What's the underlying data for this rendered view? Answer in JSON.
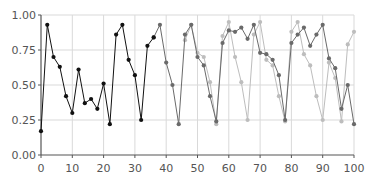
{
  "chart_data": {
    "type": "line",
    "title": "",
    "xlabel": "",
    "ylabel": "",
    "xlim": [
      0,
      100
    ],
    "ylim": [
      0,
      1
    ],
    "xticks": [
      0,
      10,
      20,
      30,
      40,
      50,
      60,
      70,
      80,
      90,
      100
    ],
    "xtick_labels": [
      "0",
      "10",
      "20",
      "30",
      "40",
      "50",
      "60",
      "70",
      "80",
      "90",
      "100"
    ],
    "yticks": [
      0,
      0.25,
      0.5,
      0.75,
      1.0
    ],
    "ytick_labels": [
      "0.00",
      "0.25",
      "0.50",
      "0.75",
      "1.00"
    ],
    "grid": true,
    "legend": null,
    "series": [
      {
        "name": "series-dark",
        "color": "#111111",
        "x": [
          0,
          2,
          4,
          6,
          8,
          10,
          12,
          14,
          16,
          18,
          20,
          22,
          24,
          26,
          28,
          30,
          32,
          34,
          36
        ],
        "values": [
          0.17,
          0.93,
          0.7,
          0.63,
          0.42,
          0.3,
          0.61,
          0.37,
          0.4,
          0.33,
          0.51,
          0.22,
          0.86,
          0.93,
          0.68,
          0.57,
          0.25,
          0.78,
          0.84
        ]
      },
      {
        "name": "series-medium",
        "color": "#6a6a6a",
        "x": [
          36,
          38,
          40,
          42,
          44,
          46,
          48,
          50,
          52,
          54,
          56,
          58,
          60,
          62,
          64,
          66,
          68,
          70,
          72,
          74,
          76,
          78,
          80,
          82,
          84,
          86,
          88,
          90,
          92,
          94,
          96,
          98,
          100
        ],
        "values": [
          0.84,
          0.93,
          0.66,
          0.5,
          0.22,
          0.86,
          0.93,
          0.7,
          0.64,
          0.42,
          0.24,
          0.8,
          0.89,
          0.88,
          0.91,
          0.83,
          0.93,
          0.73,
          0.72,
          0.68,
          0.57,
          0.25,
          0.8,
          0.86,
          0.91,
          0.78,
          0.86,
          0.93,
          0.69,
          0.62,
          0.33,
          0.5,
          0.22
        ]
      },
      {
        "name": "series-light",
        "color": "#bdbdbd",
        "x": [
          46,
          48,
          50,
          52,
          54,
          56,
          58,
          60,
          62,
          64,
          66,
          68,
          70,
          72,
          74,
          76,
          78,
          80,
          82,
          84,
          86,
          88,
          90,
          92,
          94,
          96,
          98,
          100
        ],
        "values": [
          0.82,
          0.93,
          0.73,
          0.7,
          0.52,
          0.22,
          0.85,
          0.95,
          0.7,
          0.52,
          0.25,
          0.86,
          0.95,
          0.68,
          0.64,
          0.42,
          0.24,
          0.88,
          0.95,
          0.72,
          0.64,
          0.42,
          0.25,
          0.66,
          0.55,
          0.24,
          0.79,
          0.88
        ]
      }
    ]
  }
}
